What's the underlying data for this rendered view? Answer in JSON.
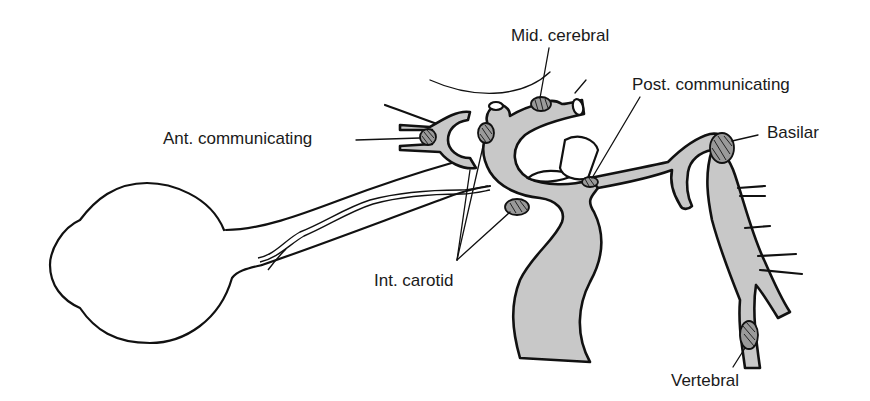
{
  "diagram": {
    "type": "anatomical-illustration",
    "colors": {
      "vessel_fill": "#c8c8c8",
      "aneurysm_fill": "#9a9a9a",
      "line": "#111111",
      "background": "#ffffff"
    },
    "labels": {
      "mid_cerebral": "Mid. cerebral",
      "ant_communicating": "Ant. communicating",
      "post_communicating": "Post. communicating",
      "basilar": "Basilar",
      "int_carotid": "Int. carotid",
      "vertebral": "Vertebral"
    },
    "structures": [
      "eyeball",
      "optic-nerve",
      "internal-carotid-artery",
      "middle-cerebral-artery",
      "anterior-communicating-artery",
      "posterior-communicating-artery",
      "basilar-artery",
      "vertebral-artery"
    ]
  }
}
